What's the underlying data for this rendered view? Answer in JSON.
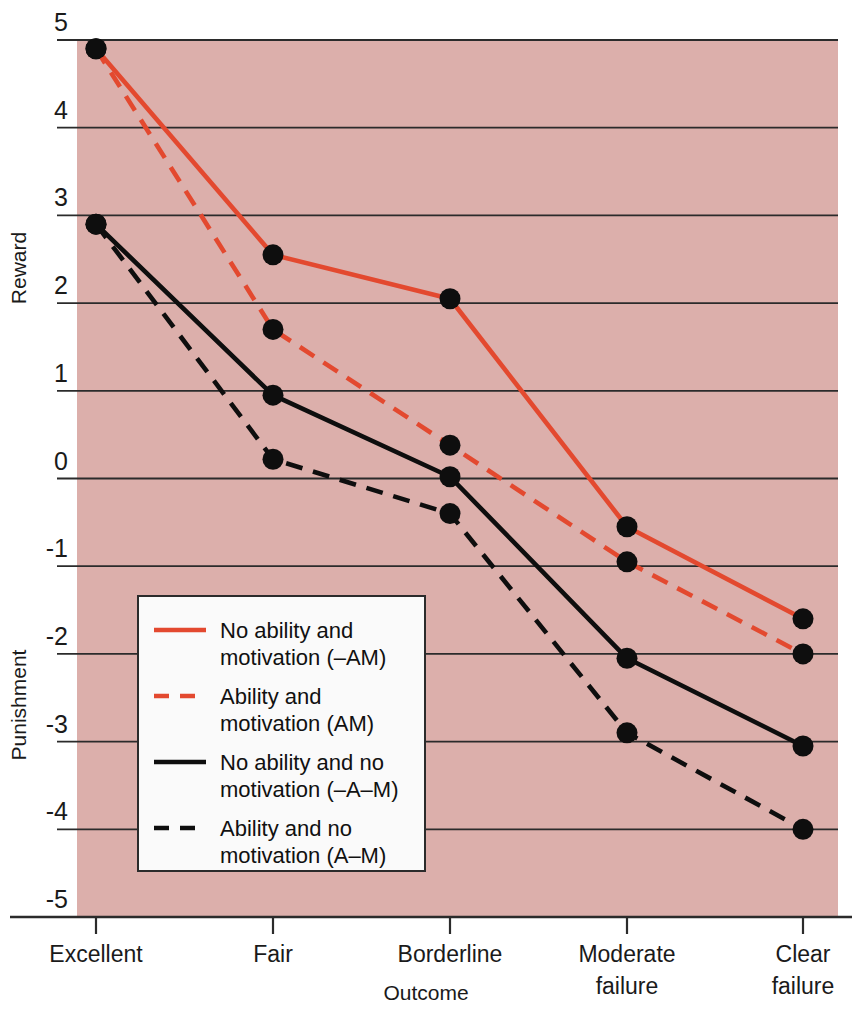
{
  "chart_data": {
    "type": "line",
    "title": "",
    "xlabel": "Outcome",
    "ylabel_upper": "Reward",
    "ylabel_lower": "Punishment",
    "categories": [
      "Excellent",
      "Fair",
      "Borderline",
      "Moderate failure",
      "Clear failure"
    ],
    "category_lines": [
      [
        "Excellent"
      ],
      [
        "Fair"
      ],
      [
        "Borderline"
      ],
      [
        "Moderate",
        "failure"
      ],
      [
        "Clear",
        "failure"
      ]
    ],
    "ylim": [
      -5,
      5
    ],
    "yticks": [
      5,
      4,
      3,
      2,
      1,
      0,
      -1,
      -2,
      -3,
      -4,
      -5
    ],
    "ytick_labels": [
      "5",
      "4",
      "3",
      "2",
      "1",
      "0",
      "-1",
      "-2",
      "-3",
      "-4",
      "-5"
    ],
    "grid": true,
    "legend_position": "inside-lower-left",
    "plot_background": "#DCAFAB",
    "series": [
      {
        "name": "No ability and motivation (-AM)",
        "label_lines": [
          "No ability and",
          "motivation (–AM)"
        ],
        "color": "#E3492F",
        "style": "solid",
        "values": [
          4.9,
          2.55,
          2.05,
          -0.55,
          -1.6
        ]
      },
      {
        "name": "Ability and motivation (AM)",
        "label_lines": [
          "Ability and",
          "motivation (AM)"
        ],
        "color": "#E3492F",
        "style": "dashed",
        "values": [
          4.9,
          1.7,
          0.38,
          -0.95,
          -2.0
        ]
      },
      {
        "name": "No ability and no motivation (-A-M)",
        "label_lines": [
          "No ability and no",
          "motivation (–A–M)"
        ],
        "color": "#0E0E0E",
        "style": "solid",
        "values": [
          2.9,
          0.95,
          0.02,
          -2.05,
          -3.05
        ]
      },
      {
        "name": "Ability and no motivation (A-M)",
        "label_lines": [
          "Ability and no",
          "motivation (A–M)"
        ],
        "color": "#0E0E0E",
        "style": "dashed",
        "values": [
          2.9,
          0.22,
          -0.4,
          -2.9,
          -4.0
        ]
      }
    ]
  }
}
